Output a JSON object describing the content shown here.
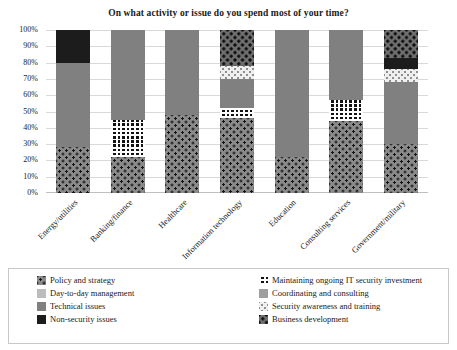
{
  "chart_data": {
    "type": "bar",
    "title": "On what activity or issue do you spend most of your time?",
    "xlabel": "",
    "ylabel": "",
    "ylim": [
      0,
      100
    ],
    "grid": true,
    "stacked": true,
    "stack_orientation": "vertical",
    "legend_position": "bottom",
    "categories": [
      "Energy/utilities",
      "Banking/finance",
      "Healthcare",
      "Information technology",
      "Education",
      "Consulting services",
      "Government/military"
    ],
    "ytick_labels": [
      "100%",
      "90%",
      "80%",
      "70%",
      "60%",
      "50%",
      "40%",
      "30%",
      "20%",
      "10%",
      "0%"
    ],
    "ytick_values": [
      100,
      90,
      80,
      70,
      60,
      50,
      40,
      30,
      20,
      10,
      0
    ],
    "series": [
      {
        "name": "Policy and strategy",
        "key": "policy",
        "pattern": "dark-dots-on-gray",
        "color": "#8a8a8a",
        "values": [
          28,
          22,
          48,
          46,
          22,
          44,
          30
        ]
      },
      {
        "name": "Day-to-day management",
        "key": "daytoday",
        "pattern": "solid-light-gray",
        "color": "#bcbcbc",
        "values": [
          0,
          0,
          0,
          0,
          0,
          0,
          0
        ]
      },
      {
        "name": "Technical issues",
        "key": "technical",
        "pattern": "solid-medium-gray",
        "color": "#808080",
        "values": [
          52,
          55,
          52,
          18,
          78,
          43,
          38
        ]
      },
      {
        "name": "Non-security issues",
        "key": "nonsecurity",
        "pattern": "solid-near-black",
        "color": "#1c1c1c",
        "values": [
          20,
          0,
          0,
          0,
          0,
          0,
          7
        ]
      },
      {
        "name": "Maintaining ongoing IT security investment",
        "key": "maintaining",
        "pattern": "black-with-white-grid",
        "color": "#121212",
        "values": [
          0,
          23,
          0,
          6,
          0,
          13,
          0
        ]
      },
      {
        "name": "Coordinating and consulting",
        "key": "coordinating",
        "pattern": "solid-gray",
        "color": "#9e9e9e",
        "values": [
          0,
          0,
          0,
          0,
          0,
          0,
          0
        ]
      },
      {
        "name": "Security awareness and training",
        "key": "awareness",
        "pattern": "light-dots-on-white",
        "color": "#efefef",
        "values": [
          0,
          0,
          0,
          8,
          0,
          0,
          8
        ]
      },
      {
        "name": "Business development",
        "key": "busdev",
        "pattern": "black-dots-on-dark-gray",
        "color": "#6f6f6f",
        "values": [
          0,
          0,
          0,
          22,
          0,
          0,
          17
        ]
      }
    ],
    "stack_order": [
      "policy",
      "maintaining",
      "technical",
      "awareness",
      "busdev",
      "nonsecurity"
    ],
    "bars": [
      {
        "category": "Energy/utilities",
        "segments": [
          {
            "key": "policy",
            "name": "Policy and strategy",
            "start": 0,
            "end": 28
          },
          {
            "key": "technical",
            "name": "Technical issues",
            "start": 28,
            "end": 80
          },
          {
            "key": "nonsecurity",
            "name": "Non-security issues",
            "start": 80,
            "end": 100
          }
        ]
      },
      {
        "category": "Banking/finance",
        "segments": [
          {
            "key": "policy",
            "name": "Policy and strategy",
            "start": 0,
            "end": 22
          },
          {
            "key": "maintaining",
            "name": "Maintaining ongoing IT security investment",
            "start": 22,
            "end": 45
          },
          {
            "key": "technical",
            "name": "Technical issues",
            "start": 45,
            "end": 100
          }
        ]
      },
      {
        "category": "Healthcare",
        "segments": [
          {
            "key": "policy",
            "name": "Policy and strategy",
            "start": 0,
            "end": 48
          },
          {
            "key": "technical",
            "name": "Technical issues",
            "start": 48,
            "end": 100
          }
        ]
      },
      {
        "category": "Information technology",
        "segments": [
          {
            "key": "policy",
            "name": "Policy and strategy",
            "start": 0,
            "end": 46
          },
          {
            "key": "maintaining",
            "name": "Maintaining ongoing IT security investment",
            "start": 46,
            "end": 52
          },
          {
            "key": "technical",
            "name": "Technical issues",
            "start": 52,
            "end": 70
          },
          {
            "key": "awareness",
            "name": "Security awareness and training",
            "start": 70,
            "end": 78
          },
          {
            "key": "busdev",
            "name": "Business development",
            "start": 78,
            "end": 100
          }
        ]
      },
      {
        "category": "Education",
        "segments": [
          {
            "key": "policy",
            "name": "Policy and strategy",
            "start": 0,
            "end": 22
          },
          {
            "key": "technical",
            "name": "Technical issues",
            "start": 22,
            "end": 100
          }
        ]
      },
      {
        "category": "Consulting services",
        "segments": [
          {
            "key": "policy",
            "name": "Policy and strategy",
            "start": 0,
            "end": 44
          },
          {
            "key": "maintaining",
            "name": "Maintaining ongoing IT security investment",
            "start": 44,
            "end": 57
          },
          {
            "key": "technical",
            "name": "Technical issues",
            "start": 57,
            "end": 100
          }
        ]
      },
      {
        "category": "Government/military",
        "segments": [
          {
            "key": "policy",
            "name": "Policy and strategy",
            "start": 0,
            "end": 30
          },
          {
            "key": "technical",
            "name": "Technical issues",
            "start": 30,
            "end": 68
          },
          {
            "key": "awareness",
            "name": "Security awareness and training",
            "start": 68,
            "end": 76
          },
          {
            "key": "nonsecurity",
            "name": "Non-security issues",
            "start": 76,
            "end": 83
          },
          {
            "key": "busdev",
            "name": "Business development",
            "start": 83,
            "end": 100
          }
        ]
      }
    ]
  },
  "legend": {
    "left_column": [
      {
        "label": "Policy and strategy",
        "key": "policy"
      },
      {
        "label": "Day-to-day management",
        "key": "daytoday"
      },
      {
        "label": "Technical issues",
        "key": "technical"
      },
      {
        "label": "Non-security issues",
        "key": "nonsecurity"
      }
    ],
    "right_column": [
      {
        "label": "Maintaining ongoing IT security investment",
        "key": "maintaining"
      },
      {
        "label": "Coordinating and consulting",
        "key": "coordinating"
      },
      {
        "label": "Security awareness and training",
        "key": "awareness"
      },
      {
        "label": "Business development",
        "key": "busdev"
      }
    ]
  }
}
